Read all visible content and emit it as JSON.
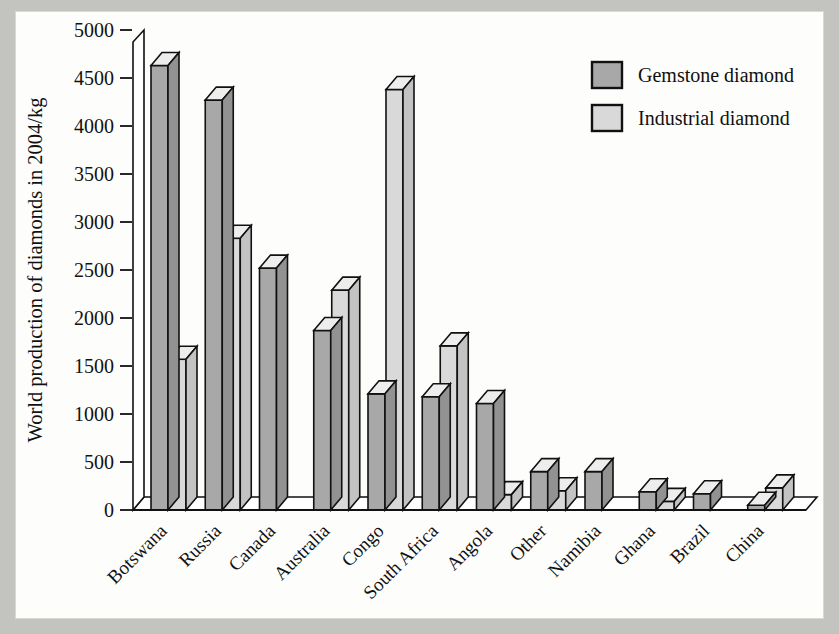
{
  "figure": {
    "background_color": "#c3c3c0",
    "plate_color": "#fdfdfb"
  },
  "legend": {
    "position": "top-right",
    "entries": [
      {
        "label": "Gemstone diamond",
        "color": "#a8a8a8",
        "name": "gemstone-diamond"
      },
      {
        "label": "Industrial diamond",
        "color": "#d9d9d9",
        "name": "industrial-diamond"
      }
    ]
  },
  "axes": {
    "ylabel": "World production of diamonds in 2004/kg",
    "xlabel": "",
    "yticks": [
      "5000",
      "4500",
      "4000",
      "3500",
      "3000",
      "2500",
      "2000",
      "1500",
      "1000",
      "500",
      "0"
    ],
    "ylim": [
      0,
      5000
    ],
    "ytick_step": 500,
    "grid": false
  },
  "chart_data": {
    "type": "bar",
    "title": "",
    "subtitle": "",
    "xlabel": "",
    "ylabel": "World production of diamonds in 2004/kg",
    "ylim": [
      0,
      5000
    ],
    "ytick_step": 500,
    "grid": false,
    "legend_position": "top-right",
    "style": "3d-columns",
    "categories": [
      "Botswana",
      "Russia",
      "Canada",
      "Australia",
      "Congo",
      "South Africa",
      "Angola",
      "Other",
      "Namibia",
      "Ghana",
      "Brazil",
      "China"
    ],
    "series": [
      {
        "name": "Gemstone diamond",
        "color": "#a8a8a8",
        "values": [
          4630,
          4270,
          2520,
          1870,
          1210,
          1180,
          1110,
          400,
          400,
          190,
          170,
          50
        ]
      },
      {
        "name": "Industrial diamond",
        "color": "#d9d9d9",
        "values": [
          1570,
          2830,
          0,
          2290,
          4380,
          1710,
          160,
          200,
          0,
          90,
          0,
          230
        ]
      }
    ]
  }
}
